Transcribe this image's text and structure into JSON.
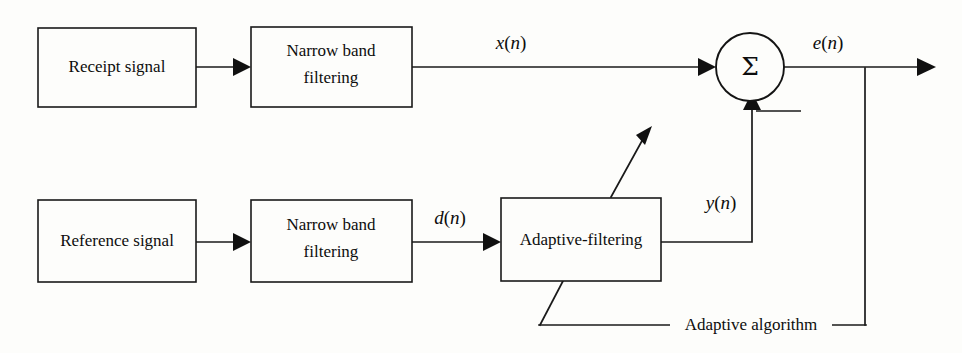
{
  "figure": {
    "type": "block-diagram",
    "canvas": {
      "width": 962,
      "height": 353
    },
    "background_color": "#fdfdfb",
    "line_color": "#1a1a1a",
    "text_color": "#0d0d0d"
  },
  "blocks": {
    "receipt_signal": {
      "label": "Receipt signal"
    },
    "narrow_band_top_line1": {
      "label": "Narrow band"
    },
    "narrow_band_top_line2": {
      "label": "filtering"
    },
    "reference_signal": {
      "label": "Reference signal"
    },
    "narrow_band_bottom_line1": {
      "label": "Narrow band"
    },
    "narrow_band_bottom_line2": {
      "label": "filtering"
    },
    "adaptive_filtering": {
      "label": "Adaptive-filtering"
    }
  },
  "nodes": {
    "summation": {
      "glyph": "Σ",
      "name": "sigma"
    }
  },
  "signals": {
    "x_n": {
      "base": "x",
      "open": "(",
      "index": "n",
      "close": ")"
    },
    "d_n": {
      "base": "d",
      "open": "(",
      "index": "n",
      "close": ")"
    },
    "y_n": {
      "base": "y",
      "open": "(",
      "index": "n",
      "close": ")"
    },
    "e_n": {
      "base": "e",
      "open": "(",
      "index": "n",
      "close": ")"
    }
  },
  "annotations": {
    "adaptive_algorithm": {
      "label": "Adaptive algorithm"
    }
  }
}
